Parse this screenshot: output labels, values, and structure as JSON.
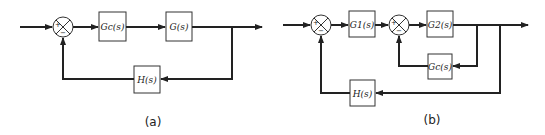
{
  "diagram_a": {
    "caption": "(a)",
    "summing_junction": {
      "plus": "+",
      "minus": "−"
    },
    "blocks": {
      "controller": "Gc(s)",
      "plant": "G(s)",
      "feedback": "H(s)"
    }
  },
  "diagram_b": {
    "caption": "(b)",
    "summing_junction_1": {
      "plus": "+",
      "minus": "−"
    },
    "summing_junction_2": {
      "plus": "+",
      "minus": "−"
    },
    "blocks": {
      "forward_1": "G1(s)",
      "forward_2": "G2(s)",
      "inner_feedback": "Gc(s)",
      "outer_feedback": "H(s)"
    }
  },
  "colors": {
    "line": "#222222",
    "background": "#ffffff"
  }
}
